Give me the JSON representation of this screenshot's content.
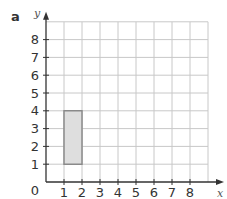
{
  "part_label": "a",
  "chart_data": {
    "type": "grid-shape",
    "title": "",
    "xlabel": "x",
    "ylabel": "y",
    "xlim": [
      0,
      9
    ],
    "ylim": [
      0,
      9
    ],
    "x_ticks": [
      "1",
      "2",
      "3",
      "4",
      "5",
      "6",
      "7",
      "8"
    ],
    "y_ticks": [
      "1",
      "2",
      "3",
      "4",
      "5",
      "6",
      "7",
      "8"
    ],
    "origin_label": "0",
    "grid": true,
    "shapes": [
      {
        "type": "rectangle",
        "vertices": [
          [
            1,
            1
          ],
          [
            2,
            1
          ],
          [
            2,
            4
          ],
          [
            1,
            4
          ]
        ],
        "fill": "#dedede",
        "stroke": "#8a8a8a"
      }
    ]
  },
  "colors": {
    "grid": "#c8c8c8",
    "axis": "#333333",
    "shape_fill": "#dedede",
    "shape_stroke": "#8a8a8a"
  }
}
